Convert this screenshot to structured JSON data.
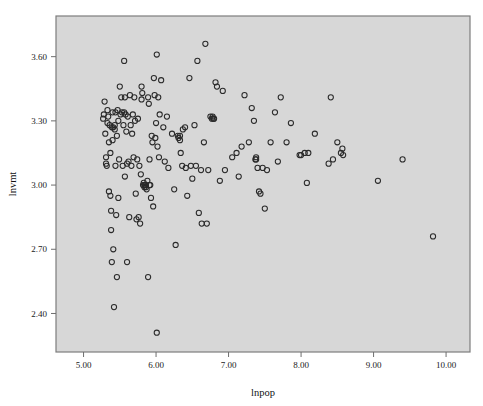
{
  "chart_data": {
    "type": "scatter",
    "title": "",
    "subtitle": "",
    "xlabel": "lnpop",
    "ylabel": "lnvmt",
    "xlim": [
      4.62,
      10.33
    ],
    "ylim": [
      2.22,
      3.79
    ],
    "xticks": [
      5.0,
      6.0,
      7.0,
      8.0,
      9.0,
      10.0
    ],
    "xtick_labels": [
      "5.00",
      "6.00",
      "7.00",
      "8.00",
      "9.00",
      "10.00"
    ],
    "yticks": [
      2.4,
      2.7,
      3.0,
      3.3,
      3.6
    ],
    "ytick_labels": [
      "2.40",
      "2.70",
      "3.00",
      "3.30",
      "3.60"
    ],
    "grid": false,
    "legend": null,
    "legend_position": "none",
    "marker": "open-circle",
    "marker_size": 5.2,
    "marker_color": "#2a2a2a",
    "plot_background": "#d7d7d7",
    "figure_background": "#ffffff",
    "frame_color": "#7d7d7d",
    "n_points": 176,
    "points": [
      [
        5.27,
        3.31
      ],
      [
        5.28,
        3.33
      ],
      [
        5.29,
        3.39
      ],
      [
        5.3,
        3.24
      ],
      [
        5.31,
        3.13
      ],
      [
        5.31,
        3.1
      ],
      [
        5.32,
        3.09
      ],
      [
        5.33,
        3.35
      ],
      [
        5.34,
        3.32
      ],
      [
        5.35,
        3.2
      ],
      [
        5.35,
        2.97
      ],
      [
        5.36,
        3.28
      ],
      [
        5.37,
        3.15
      ],
      [
        5.37,
        2.95
      ],
      [
        5.38,
        2.88
      ],
      [
        5.38,
        2.79
      ],
      [
        5.39,
        3.27
      ],
      [
        5.39,
        2.64
      ],
      [
        5.4,
        3.34
      ],
      [
        5.4,
        3.21
      ],
      [
        5.41,
        3.27
      ],
      [
        5.41,
        2.7
      ],
      [
        5.42,
        2.43
      ],
      [
        5.43,
        3.28
      ],
      [
        5.44,
        3.34
      ],
      [
        5.44,
        3.09
      ],
      [
        5.45,
        2.86
      ],
      [
        5.46,
        3.23
      ],
      [
        5.46,
        2.57
      ],
      [
        5.47,
        3.35
      ],
      [
        5.48,
        3.3
      ],
      [
        5.48,
        2.94
      ],
      [
        5.49,
        3.12
      ],
      [
        5.5,
        3.46
      ],
      [
        5.51,
        3.33
      ],
      [
        5.52,
        3.41
      ],
      [
        5.53,
        3.34
      ],
      [
        5.54,
        3.09
      ],
      [
        5.55,
        3.28
      ],
      [
        5.56,
        3.58
      ],
      [
        5.57,
        3.41
      ],
      [
        5.57,
        3.04
      ],
      [
        5.58,
        3.33
      ],
      [
        5.59,
        3.25
      ],
      [
        5.6,
        3.1
      ],
      [
        5.6,
        2.64
      ],
      [
        5.61,
        3.32
      ],
      [
        5.62,
        3.11
      ],
      [
        5.63,
        2.85
      ],
      [
        5.64,
        3.42
      ],
      [
        5.65,
        3.28
      ],
      [
        5.66,
        3.09
      ],
      [
        5.67,
        3.24
      ],
      [
        5.68,
        3.33
      ],
      [
        5.69,
        3.13
      ],
      [
        5.7,
        3.41
      ],
      [
        5.71,
        3.3
      ],
      [
        5.72,
        2.96
      ],
      [
        5.73,
        2.84
      ],
      [
        5.74,
        3.12
      ],
      [
        5.75,
        3.31
      ],
      [
        5.76,
        2.85
      ],
      [
        5.77,
        3.09
      ],
      [
        5.78,
        2.82
      ],
      [
        5.79,
        3.05
      ],
      [
        5.8,
        3.46
      ],
      [
        5.8,
        3.4
      ],
      [
        5.81,
        3.43
      ],
      [
        5.82,
        3.0
      ],
      [
        5.83,
        3.01
      ],
      [
        5.84,
        3.0
      ],
      [
        5.84,
        2.99
      ],
      [
        5.85,
        3.0
      ],
      [
        5.86,
        2.99
      ],
      [
        5.86,
        3.0
      ],
      [
        5.87,
        2.98
      ],
      [
        5.88,
        3.02
      ],
      [
        5.89,
        3.41
      ],
      [
        5.89,
        2.57
      ],
      [
        5.9,
        3.38
      ],
      [
        5.91,
        3.0
      ],
      [
        5.92,
        3.0
      ],
      [
        5.93,
        2.94
      ],
      [
        5.94,
        3.23
      ],
      [
        5.95,
        3.2
      ],
      [
        5.96,
        2.9
      ],
      [
        5.97,
        3.5
      ],
      [
        5.98,
        3.42
      ],
      [
        5.99,
        3.22
      ],
      [
        6.0,
        3.29
      ],
      [
        6.01,
        3.61
      ],
      [
        6.01,
        2.31
      ],
      [
        6.02,
        3.18
      ],
      [
        6.03,
        3.41
      ],
      [
        6.04,
        3.13
      ],
      [
        6.05,
        3.33
      ],
      [
        6.07,
        3.49
      ],
      [
        6.1,
        3.27
      ],
      [
        6.12,
        3.11
      ],
      [
        6.15,
        3.32
      ],
      [
        6.17,
        3.08
      ],
      [
        6.22,
        3.24
      ],
      [
        6.25,
        2.98
      ],
      [
        6.27,
        2.72
      ],
      [
        6.3,
        3.23
      ],
      [
        6.31,
        3.22
      ],
      [
        6.33,
        3.23
      ],
      [
        6.34,
        3.15
      ],
      [
        6.36,
        3.09
      ],
      [
        6.37,
        3.26
      ],
      [
        6.4,
        3.27
      ],
      [
        6.41,
        3.08
      ],
      [
        6.43,
        2.95
      ],
      [
        6.46,
        3.5
      ],
      [
        6.48,
        3.09
      ],
      [
        6.5,
        3.03
      ],
      [
        6.53,
        3.28
      ],
      [
        6.55,
        3.09
      ],
      [
        6.57,
        3.58
      ],
      [
        6.59,
        2.87
      ],
      [
        6.62,
        3.07
      ],
      [
        6.63,
        2.82
      ],
      [
        6.66,
        3.2
      ],
      [
        6.68,
        3.66
      ],
      [
        6.7,
        2.82
      ],
      [
        6.72,
        3.07
      ],
      [
        6.75,
        3.32
      ],
      [
        6.77,
        3.31
      ],
      [
        6.79,
        3.31
      ],
      [
        6.8,
        3.31
      ],
      [
        6.82,
        3.48
      ],
      [
        6.84,
        3.46
      ],
      [
        6.88,
        3.02
      ],
      [
        6.92,
        3.44
      ],
      [
        6.95,
        3.07
      ],
      [
        7.05,
        3.13
      ],
      [
        7.11,
        3.15
      ],
      [
        7.14,
        3.04
      ],
      [
        7.18,
        3.18
      ],
      [
        7.22,
        3.42
      ],
      [
        7.28,
        3.2
      ],
      [
        7.32,
        3.36
      ],
      [
        7.35,
        3.3
      ],
      [
        7.37,
        3.12
      ],
      [
        7.38,
        3.12
      ],
      [
        7.4,
        3.08
      ],
      [
        7.42,
        2.97
      ],
      [
        7.44,
        2.96
      ],
      [
        7.47,
        3.08
      ],
      [
        7.5,
        2.89
      ],
      [
        7.53,
        3.07
      ],
      [
        7.58,
        3.2
      ],
      [
        7.64,
        3.34
      ],
      [
        7.68,
        3.11
      ],
      [
        7.72,
        3.41
      ],
      [
        7.8,
        3.2
      ],
      [
        7.86,
        3.29
      ],
      [
        7.98,
        3.14
      ],
      [
        8.0,
        3.14
      ],
      [
        8.05,
        3.15
      ],
      [
        8.08,
        3.01
      ],
      [
        8.1,
        3.15
      ],
      [
        8.19,
        3.24
      ],
      [
        8.38,
        3.1
      ],
      [
        8.41,
        3.41
      ],
      [
        8.44,
        3.12
      ],
      [
        8.5,
        3.2
      ],
      [
        8.55,
        3.15
      ],
      [
        8.57,
        3.17
      ],
      [
        8.58,
        3.14
      ],
      [
        9.06,
        3.02
      ],
      [
        9.4,
        3.12
      ],
      [
        9.82,
        2.76
      ],
      [
        5.33,
        3.29
      ],
      [
        5.43,
        3.26
      ],
      [
        5.56,
        3.34
      ],
      [
        5.91,
        3.12
      ],
      [
        6.33,
        3.21
      ],
      [
        6.78,
        3.32
      ],
      [
        7.38,
        3.13
      ]
    ]
  }
}
